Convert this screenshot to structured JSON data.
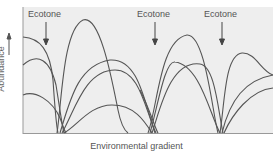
{
  "diagram": {
    "background_color": "#eeeeee",
    "curve_color": "#555555",
    "axis_color": "#999999",
    "y_axis_label": "Abundance",
    "x_axis_label": "Environmental gradient",
    "ecotones": [
      {
        "label": "Ecotone",
        "x": 46
      },
      {
        "label": "Ecotone",
        "x": 155
      },
      {
        "label": "Ecotone",
        "x": 222
      }
    ],
    "communities": [
      {
        "name": "community-1",
        "range": "left edge to first ecotone",
        "species_curves": 3
      },
      {
        "name": "community-2",
        "range": "first ecotone to second ecotone",
        "species_curves": 4
      },
      {
        "name": "community-3",
        "range": "second ecotone to third ecotone",
        "species_curves": 4
      },
      {
        "name": "community-4",
        "range": "third ecotone to right edge",
        "species_curves": 3
      }
    ]
  }
}
